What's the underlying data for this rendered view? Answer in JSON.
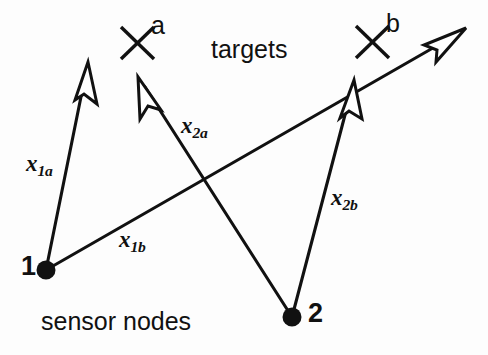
{
  "figure": {
    "background_color": "#fdfdfd",
    "ink_color": "#111111",
    "captions": {
      "targets": "targets",
      "sensor_nodes": "sensor nodes"
    },
    "targets": [
      {
        "id": "a",
        "label": "a",
        "marker": "x-cross",
        "cx": 137,
        "cy": 43
      },
      {
        "id": "b",
        "label": "b",
        "marker": "x-cross",
        "cx": 372,
        "cy": 42
      }
    ],
    "nodes": [
      {
        "id": "1",
        "label": "1",
        "marker": "filled-dot",
        "cx": 46,
        "cy": 270
      },
      {
        "id": "2",
        "label": "2",
        "marker": "filled-dot",
        "cx": 292,
        "cy": 317
      }
    ],
    "vectors": [
      {
        "id": "x1a",
        "base": "x",
        "subscript": "1a",
        "from_node": "1",
        "to_target": "a",
        "x1": 46,
        "y1": 270,
        "x2": 88,
        "y2": 63,
        "label_x": 26,
        "label_y": 152
      },
      {
        "id": "x1b",
        "base": "x",
        "subscript": "1b",
        "from_node": "1",
        "to_target": "b",
        "x1": 46,
        "y1": 270,
        "x2": 466,
        "y2": 29,
        "label_x": 119,
        "label_y": 228
      },
      {
        "id": "x2a",
        "base": "x",
        "subscript": "2a",
        "from_node": "2",
        "to_target": "a",
        "x1": 292,
        "y1": 317,
        "x2": 139,
        "y2": 78,
        "label_x": 181,
        "label_y": 114
      },
      {
        "id": "x2b",
        "base": "x",
        "subscript": "2b",
        "from_node": "2",
        "to_target": "b",
        "x1": 292,
        "y1": 317,
        "x2": 354,
        "y2": 81,
        "label_x": 331,
        "label_y": 186
      }
    ],
    "target_labels": [
      {
        "id": "a",
        "text": "a",
        "x": 151,
        "y": 13
      },
      {
        "id": "b",
        "text": "b",
        "x": 386,
        "y": 11
      }
    ],
    "node_labels": [
      {
        "id": "1",
        "text": "1",
        "x": 21,
        "y": 254
      },
      {
        "id": "2",
        "text": "2",
        "x": 308,
        "y": 301
      }
    ],
    "caption_positions": {
      "targets": {
        "x": 211,
        "y": 37
      },
      "sensor_nodes": {
        "x": 41,
        "y": 309
      }
    }
  }
}
